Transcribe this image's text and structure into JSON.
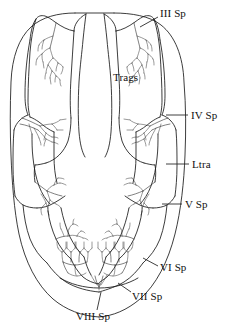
{
  "figure": {
    "type": "scientific-line-drawing",
    "background_color": "#ffffff",
    "ink_color": "#1a1a1a",
    "width": 232,
    "height": 329
  },
  "labels": [
    {
      "id": "iii-sp",
      "text": "III Sp",
      "meaning": "third spiracle",
      "x": 160,
      "y": 8,
      "leader": {
        "x1": 158,
        "y1": 17,
        "x2": 140,
        "y2": 27
      }
    },
    {
      "id": "trags",
      "text": "Trags",
      "meaning": "tracheae",
      "x": 113,
      "y": 72,
      "leader": null
    },
    {
      "id": "iv-sp",
      "text": "IV Sp",
      "meaning": "fourth spiracle",
      "x": 191,
      "y": 110,
      "leader": {
        "x1": 188,
        "y1": 115,
        "x2": 166,
        "y2": 115
      }
    },
    {
      "id": "ltra",
      "text": "Ltra",
      "meaning": "longitudinal trachea",
      "x": 192,
      "y": 159,
      "leader": {
        "x1": 189,
        "y1": 164,
        "x2": 166,
        "y2": 164
      }
    },
    {
      "id": "v-sp",
      "text": "V Sp",
      "meaning": "fifth spiracle",
      "x": 185,
      "y": 199,
      "leader": {
        "x1": 182,
        "y1": 204,
        "x2": 162,
        "y2": 204
      }
    },
    {
      "id": "vi-sp",
      "text": "VI Sp",
      "meaning": "sixth spiracle",
      "x": 160,
      "y": 262,
      "leader": {
        "x1": 158,
        "y1": 266,
        "x2": 143,
        "y2": 258
      }
    },
    {
      "id": "vii-sp",
      "text": "VII Sp",
      "meaning": "seventh spiracle",
      "x": 132,
      "y": 291,
      "leader": {
        "x1": 131,
        "y1": 292,
        "x2": 118,
        "y2": 283
      }
    },
    {
      "id": "viii-sp",
      "text": "VIII Sp",
      "meaning": "eighth spiracle",
      "x": 76,
      "y": 311,
      "leader": {
        "x1": 97,
        "y1": 310,
        "x2": 101,
        "y2": 292
      }
    }
  ],
  "anatomy": {
    "body_outline": "oval carapace outline",
    "midline_structure": "median tracheal trunk (Trags)",
    "spiracle_count": 6,
    "symmetry": "bilateral"
  }
}
